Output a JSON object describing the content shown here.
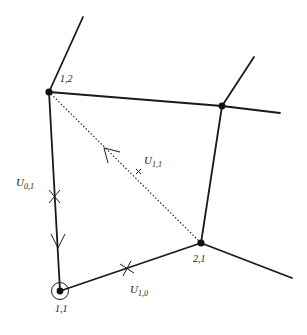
{
  "diagram": {
    "vertices": [
      {
        "id": "1,2",
        "label": "1,2",
        "x": 49,
        "y": 92
      },
      {
        "id": "top-right",
        "label": "",
        "x": 222,
        "y": 106
      },
      {
        "id": "2,1",
        "label": "2,1",
        "x": 201,
        "y": 243
      },
      {
        "id": "1,1",
        "label": "1,1",
        "x": 60,
        "y": 291,
        "circled": true
      }
    ],
    "edge_labels": {
      "u01": {
        "main": "U",
        "sub": "0,1"
      },
      "u10": {
        "main": "U",
        "sub": "1,0"
      },
      "u11": {
        "main": "U",
        "sub": "1,1"
      }
    },
    "colors": {
      "ink": "#1a1a1a",
      "background": "#ffffff"
    }
  }
}
